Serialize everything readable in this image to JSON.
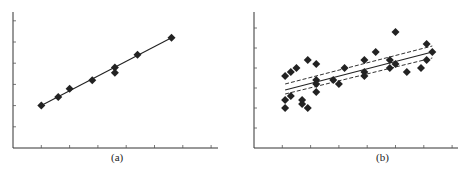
{
  "chart_data": [
    {
      "type": "scatter",
      "title": "",
      "caption": "(a)",
      "xlabel": "",
      "ylabel": "",
      "grid": false,
      "legend": null,
      "x_ticks": 7,
      "y_ticks": 6,
      "xlim": [
        0,
        7
      ],
      "ylim": [
        0,
        6.5
      ],
      "points": [
        {
          "x": 1.0,
          "y": 2.0
        },
        {
          "x": 1.6,
          "y": 2.4
        },
        {
          "x": 2.0,
          "y": 2.8
        },
        {
          "x": 2.8,
          "y": 3.2
        },
        {
          "x": 3.6,
          "y": 3.8
        },
        {
          "x": 3.6,
          "y": 3.55
        },
        {
          "x": 4.4,
          "y": 4.4
        },
        {
          "x": 5.6,
          "y": 5.2
        }
      ],
      "fit_line": {
        "style": "solid",
        "from": {
          "x": 1.0,
          "y": 2.0
        },
        "to": {
          "x": 5.6,
          "y": 5.2
        }
      }
    },
    {
      "type": "scatter",
      "title": "",
      "caption": "(b)",
      "xlabel": "",
      "ylabel": "",
      "grid": false,
      "legend": null,
      "x_ticks": 7,
      "y_ticks": 6,
      "xlim": [
        0,
        7
      ],
      "ylim": [
        0,
        6.5
      ],
      "points": [
        {
          "x": 1.1,
          "y": 3.6
        },
        {
          "x": 1.3,
          "y": 3.8
        },
        {
          "x": 1.5,
          "y": 4.0
        },
        {
          "x": 1.9,
          "y": 4.4
        },
        {
          "x": 2.2,
          "y": 4.2
        },
        {
          "x": 2.2,
          "y": 3.4
        },
        {
          "x": 2.2,
          "y": 3.2
        },
        {
          "x": 2.2,
          "y": 2.8
        },
        {
          "x": 1.1,
          "y": 2.4
        },
        {
          "x": 1.1,
          "y": 2.0
        },
        {
          "x": 1.3,
          "y": 2.6
        },
        {
          "x": 1.7,
          "y": 2.4
        },
        {
          "x": 1.7,
          "y": 2.2
        },
        {
          "x": 1.9,
          "y": 2.0
        },
        {
          "x": 2.8,
          "y": 3.4
        },
        {
          "x": 3.0,
          "y": 3.2
        },
        {
          "x": 3.2,
          "y": 4.0
        },
        {
          "x": 3.9,
          "y": 4.4
        },
        {
          "x": 3.9,
          "y": 3.8
        },
        {
          "x": 3.9,
          "y": 3.6
        },
        {
          "x": 4.3,
          "y": 4.8
        },
        {
          "x": 4.8,
          "y": 4.4
        },
        {
          "x": 4.8,
          "y": 4.0
        },
        {
          "x": 5.0,
          "y": 5.8
        },
        {
          "x": 5.0,
          "y": 4.2
        },
        {
          "x": 5.4,
          "y": 3.8
        },
        {
          "x": 5.9,
          "y": 4.0
        },
        {
          "x": 6.1,
          "y": 5.2
        },
        {
          "x": 6.1,
          "y": 4.4
        },
        {
          "x": 6.3,
          "y": 4.8
        }
      ],
      "fit_line": {
        "style": "solid",
        "from": {
          "x": 1.1,
          "y": 2.9
        },
        "to": {
          "x": 6.3,
          "y": 4.8
        }
      },
      "confidence_bands": [
        {
          "style": "dashed",
          "from": {
            "x": 1.1,
            "y": 3.2
          },
          "to": {
            "x": 6.3,
            "y": 5.1
          }
        },
        {
          "style": "dashed",
          "from": {
            "x": 1.1,
            "y": 2.7
          },
          "to": {
            "x": 6.3,
            "y": 4.5
          }
        }
      ]
    }
  ]
}
